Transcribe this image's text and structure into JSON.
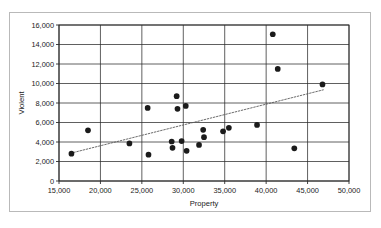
{
  "chart_data": {
    "type": "scatter",
    "title": "",
    "xlabel": "Property",
    "ylabel": "Violent",
    "xlim": [
      15000,
      50000
    ],
    "ylim": [
      0,
      16000
    ],
    "xticks": [
      15000,
      20000,
      25000,
      30000,
      35000,
      40000,
      45000,
      50000
    ],
    "yticks": [
      0,
      2000,
      4000,
      6000,
      8000,
      10000,
      12000,
      14000,
      16000
    ],
    "xtick_labels": [
      "15,000",
      "20,000",
      "25,000",
      "30,000",
      "35,000",
      "40,000",
      "45,000",
      "50,000"
    ],
    "ytick_labels": [
      "0",
      "2,000",
      "4,000",
      "6,000",
      "8,000",
      "10,000",
      "12,000",
      "14,000",
      "16,000"
    ],
    "grid": "both",
    "legend": "none",
    "marker": "filled-circle",
    "marker_color": "#1b1b1b",
    "points": [
      {
        "x": 16500,
        "y": 2800
      },
      {
        "x": 18500,
        "y": 5200
      },
      {
        "x": 23500,
        "y": 3850
      },
      {
        "x": 25700,
        "y": 7500
      },
      {
        "x": 25800,
        "y": 2700
      },
      {
        "x": 28600,
        "y": 4050
      },
      {
        "x": 28700,
        "y": 3400
      },
      {
        "x": 29200,
        "y": 8700
      },
      {
        "x": 29300,
        "y": 7400
      },
      {
        "x": 29800,
        "y": 4100
      },
      {
        "x": 30300,
        "y": 7700
      },
      {
        "x": 30400,
        "y": 3100
      },
      {
        "x": 31900,
        "y": 3700
      },
      {
        "x": 32400,
        "y": 5250
      },
      {
        "x": 32500,
        "y": 4500
      },
      {
        "x": 34800,
        "y": 5100
      },
      {
        "x": 35500,
        "y": 5450
      },
      {
        "x": 38900,
        "y": 5750
      },
      {
        "x": 40800,
        "y": 15050
      },
      {
        "x": 41400,
        "y": 11500
      },
      {
        "x": 43400,
        "y": 3350
      },
      {
        "x": 46800,
        "y": 9900
      }
    ],
    "trendline": {
      "style": "dotted",
      "color": "#5a5a5a",
      "x_start": 16400,
      "y_start": 2850,
      "x_end": 46900,
      "y_end": 9350
    }
  }
}
